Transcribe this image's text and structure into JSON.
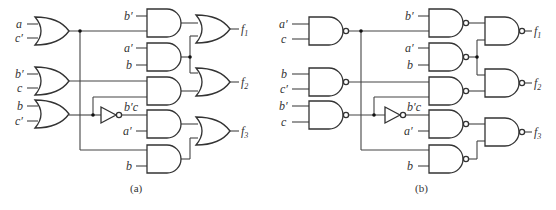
{
  "figure": {
    "panels": [
      {
        "id": "a",
        "caption": "(a)",
        "first_level_gate_type": "OR",
        "second_level_gate_type": "AND",
        "output_gate_type": "OR",
        "first_level": [
          {
            "inputs": [
              "a",
              "c′"
            ]
          },
          {
            "inputs": [
              "b′",
              "c"
            ]
          },
          {
            "inputs": [
              "b",
              "c′"
            ]
          }
        ],
        "inverter_label": "b′c",
        "second_level_inputs": [
          "b′",
          "a′",
          "b",
          "a′",
          "b"
        ],
        "outputs": [
          "f1",
          "f2",
          "f3"
        ]
      },
      {
        "id": "b",
        "caption": "(b)",
        "first_level_gate_type": "NAND",
        "second_level_gate_type": "NAND",
        "output_gate_type": "NAND",
        "first_level": [
          {
            "inputs": [
              "a′",
              "c"
            ]
          },
          {
            "inputs": [
              "b",
              "c′"
            ]
          },
          {
            "inputs": [
              "b′",
              "c"
            ]
          }
        ],
        "inverter_label": "b′c",
        "second_level_inputs": [
          "b′",
          "a′",
          "b",
          "a′",
          "b"
        ],
        "outputs": [
          "f1",
          "f2",
          "f3"
        ]
      }
    ]
  },
  "labels": {
    "a": {
      "in1a": "a",
      "in1b": "c′",
      "in2a": "b′",
      "in2b": "c",
      "in3a": "b",
      "in3b": "c′",
      "and1": "b′",
      "and2a": "a′",
      "and2b": "b",
      "inv": "b′c",
      "and4": "a′",
      "and5": "b",
      "f1": "f",
      "f1sub": "1",
      "f2": "f",
      "f2sub": "2",
      "f3": "f",
      "f3sub": "3",
      "caption": "(a)"
    },
    "b": {
      "in1a": "a′",
      "in1b": "c",
      "in2a": "b",
      "in2b": "c′",
      "in3a": "b′",
      "in3b": "c",
      "and1": "b′",
      "and2a": "a′",
      "and2b": "b",
      "inv": "b′c",
      "and4": "a′",
      "and5": "b",
      "f1": "f",
      "f1sub": "1",
      "f2": "f",
      "f2sub": "2",
      "f3": "f",
      "f3sub": "3",
      "caption": "(b)"
    }
  }
}
